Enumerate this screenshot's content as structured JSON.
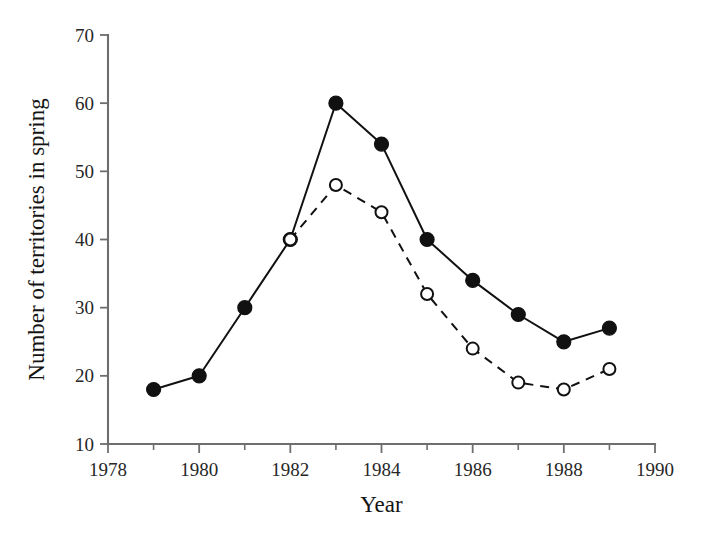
{
  "chart_data": {
    "type": "line",
    "title": "",
    "xlabel": "Year",
    "ylabel": "Number of territories in spring",
    "xlim": [
      1978,
      1990
    ],
    "ylim": [
      10,
      70
    ],
    "grid": false,
    "legend_position": "none",
    "x_ticks": [
      1978,
      1979,
      1980,
      1981,
      1982,
      1983,
      1984,
      1985,
      1986,
      1987,
      1988,
      1989,
      1990
    ],
    "x_tick_labels": [
      "1978",
      "",
      "1980",
      "",
      "1982",
      "",
      "1984",
      "",
      "1986",
      "",
      "1988",
      "",
      "1990"
    ],
    "x_major_ticks": [
      1978,
      1980,
      1982,
      1984,
      1986,
      1988,
      1990
    ],
    "y_ticks": [
      10,
      20,
      30,
      40,
      50,
      60,
      70
    ],
    "y_tick_labels": [
      "10",
      "20",
      "30",
      "40",
      "50",
      "60",
      "70"
    ],
    "series": [
      {
        "name": "filled-circles-solid",
        "marker": "filled-circle",
        "linestyle": "solid",
        "color": "#111111",
        "x": [
          1979,
          1980,
          1981,
          1982,
          1983,
          1984,
          1985,
          1986,
          1987,
          1988,
          1989
        ],
        "values": [
          18,
          20,
          30,
          40,
          60,
          54,
          40,
          34,
          29,
          25,
          27
        ]
      },
      {
        "name": "open-circles-dashed",
        "marker": "open-circle",
        "linestyle": "dashed",
        "color": "#111111",
        "x": [
          1982,
          1983,
          1984,
          1985,
          1986,
          1987,
          1988,
          1989
        ],
        "values": [
          40,
          48,
          44,
          32,
          24,
          19,
          18,
          21
        ]
      }
    ]
  }
}
